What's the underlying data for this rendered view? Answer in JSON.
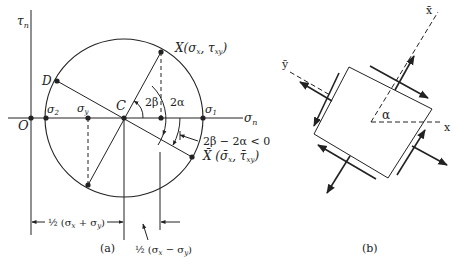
{
  "panel_a": {
    "caption": "(a)",
    "axes": {
      "vertical": "τ",
      "vertical_sub": "n",
      "horizontal": "σ",
      "horizontal_sub": "n"
    },
    "points": {
      "origin": "O",
      "sigma2": "σ",
      "sigma2_sub": "2",
      "sigma_y": "σ",
      "sigma_y_sub": "y",
      "center": "C",
      "sigma1": "σ",
      "sigma1_sub": "1",
      "D": "D",
      "X": "X(σ",
      "X_sub1": "x",
      "X_mid": ", τ",
      "X_sub2": "xy",
      "X_end": ")",
      "Xbar": "X̄ (σ̄",
      "Xbar_sub1": "x",
      "Xbar_mid": ", τ̄",
      "Xbar_sub2": "xy",
      "Xbar_end": ")"
    },
    "angles": {
      "two_beta": "2β",
      "two_alpha": "2α",
      "difference": "2β − 2α < 0"
    },
    "dimensions": {
      "half_sum": "½ (σ",
      "half_sum_sub1": "x",
      "half_sum_mid": " + σ",
      "half_sum_sub2": "y",
      "half_sum_end": ")",
      "half_diff": "½ (σ",
      "half_diff_sub1": "x",
      "half_diff_mid": " − σ",
      "half_diff_sub2": "y",
      "half_diff_end": ")"
    }
  },
  "panel_b": {
    "caption": "(b)",
    "axis_x": "x",
    "axis_xbar": "x̄",
    "axis_ybar": "ȳ",
    "angle": "α"
  },
  "colors": {
    "ink": "#222222",
    "background": "#ffffff"
  }
}
